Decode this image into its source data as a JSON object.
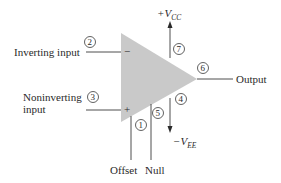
{
  "diagram": {
    "colors": {
      "body_fill": "#c9c9c9",
      "line": "#3a3a3a",
      "text": "#2a2a2a"
    },
    "symbols": {
      "inverting": "−",
      "noninverting": "+"
    },
    "labels": {
      "inverting_input": "Inverting input",
      "noninverting_line1": "Noninverting",
      "noninverting_line2": "input",
      "output": "Output",
      "vcc_prefix": "+V",
      "vcc_sub": "CC",
      "vee_prefix": "−V",
      "vee_sub": "EE",
      "offset": "Offset",
      "null": "Null"
    },
    "pins": {
      "p1": "1",
      "p2": "2",
      "p3": "3",
      "p4": "4",
      "p5": "5",
      "p6": "6",
      "p7": "7"
    }
  }
}
